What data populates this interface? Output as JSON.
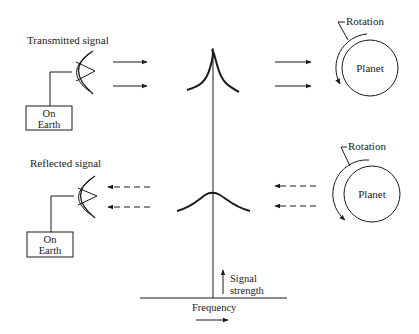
{
  "diagram": {
    "type": "radar-doppler-signal-diagram",
    "top_row": {
      "label": "Transmitted signal",
      "source_box": {
        "line1": "On",
        "line2": "Earth"
      },
      "arrow_style": "solid",
      "arrow_direction": "right",
      "peak_shape": "narrow",
      "planet_label": "Planet",
      "rotation_label": "Rotation"
    },
    "bottom_row": {
      "label": "Reflected signal",
      "source_box": {
        "line1": "On",
        "line2": "Earth"
      },
      "arrow_style": "dashed",
      "arrow_direction": "left",
      "peak_shape": "broad",
      "planet_label": "Planet",
      "rotation_label": "Rotation"
    },
    "axes": {
      "y_label_line1": "Signal",
      "y_label_line2": "strength",
      "x_label": "Frequency"
    },
    "colors": {
      "ink": "#1a1a1a",
      "background": "#ffffff"
    }
  }
}
